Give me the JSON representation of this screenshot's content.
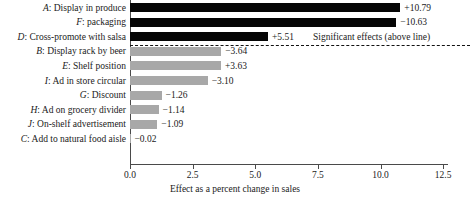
{
  "chart_data": {
    "type": "bar",
    "orientation": "horizontal",
    "title": "",
    "xlabel": "Effect as a percent change in sales",
    "ylabel": "",
    "xlim": [
      0.0,
      13.0
    ],
    "xticks": [
      0.0,
      2.5,
      5.0,
      7.5,
      10.0,
      12.5
    ],
    "xtick_labels": [
      "0.0",
      "2.5",
      "5.0",
      "7.5",
      "10.0",
      "12.5"
    ],
    "grid": false,
    "legend": null,
    "note": "Bars show absolute magnitude; sign shown in the data label.",
    "annotations": [
      {
        "text": "Significant effects (above line)",
        "type": "divider-note"
      }
    ],
    "categories": [
      "A: Display in produce",
      "F: packaging",
      "D: Cross-promote with salsa",
      "B: Display rack by beer",
      "E: Shelf position",
      "I: Ad in store circular",
      "G: Discount",
      "H: Ad on grocery divider",
      "J: On-shelf advertisement",
      "C: Add to natural food aisle"
    ],
    "values": [
      10.79,
      -10.63,
      5.51,
      -3.64,
      3.63,
      -3.1,
      -1.26,
      -1.14,
      -1.09,
      -0.02
    ],
    "magnitudes": [
      10.79,
      10.63,
      5.51,
      3.64,
      3.63,
      3.1,
      1.26,
      1.14,
      1.09,
      0.02
    ],
    "value_labels": [
      "+10.79",
      "−10.63",
      "+5.51",
      "−3.64",
      "+3.63",
      "−3.10",
      "−1.26",
      "−1.14",
      "−1.09",
      "−0.02"
    ],
    "significant": [
      true,
      true,
      true,
      false,
      false,
      false,
      false,
      false,
      false,
      false
    ],
    "colors": {
      "significant_bar": "#050505",
      "nonsignificant_bar": "#a8a8a8",
      "axis": "#4a4a4a",
      "text": "#1a1a1a",
      "background": "#ffffff"
    }
  },
  "rows": [
    {
      "key": "A",
      "name": "Display in produce",
      "value_label": "+10.79"
    },
    {
      "key": "F",
      "name": "packaging",
      "value_label": "−10.63"
    },
    {
      "key": "D",
      "name": "Cross-promote with salsa",
      "value_label": "+5.51"
    },
    {
      "key": "B",
      "name": "Display rack by beer",
      "value_label": "−3.64"
    },
    {
      "key": "E",
      "name": "Shelf position",
      "value_label": "+3.63"
    },
    {
      "key": "I",
      "name": "Ad in store circular",
      "value_label": "−3.10"
    },
    {
      "key": "G",
      "name": "Discount",
      "value_label": "−1.26"
    },
    {
      "key": "H",
      "name": "Ad on grocery divider",
      "value_label": "−1.14"
    },
    {
      "key": "J",
      "name": "On-shelf advertisement",
      "value_label": "−1.09"
    },
    {
      "key": "C",
      "name": "Add to natural food aisle",
      "value_label": "−0.02"
    }
  ],
  "divider_note": "Significant effects (above line)",
  "axis": {
    "xlabel": "Effect as a percent change in sales",
    "tick_labels": [
      "0.0",
      "2.5",
      "5.0",
      "7.5",
      "10.0",
      "12.5"
    ]
  }
}
